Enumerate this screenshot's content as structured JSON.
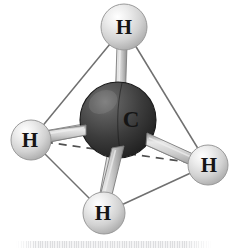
{
  "figure": {
    "background_color": "#ffffff"
  },
  "molecule": {
    "formula": "CH4",
    "geometry": "tetrahedral",
    "center_atom": {
      "id": "carbon-center",
      "label": "C",
      "element": "C",
      "cx": 118,
      "cy": 120,
      "r": 38,
      "fill_color": "#3a3a3a",
      "highlight_color": "#6e6e6e",
      "edge_color": "#1d1d1d"
    },
    "hydrogen_atoms": [
      {
        "id": "hydrogen-top",
        "label": "H",
        "element": "H",
        "position": "top",
        "cx": 124,
        "cy": 27,
        "r": 23,
        "fill_color": "#d8d8d8",
        "highlight_color": "#f7f7f7",
        "edge_color": "#9a9a9a"
      },
      {
        "id": "hydrogen-left",
        "label": "H",
        "element": "H",
        "position": "left",
        "cx": 31,
        "cy": 140,
        "r": 20,
        "fill_color": "#d6d6d6",
        "highlight_color": "#f5f5f5",
        "edge_color": "#9a9a9a"
      },
      {
        "id": "hydrogen-right",
        "label": "H",
        "element": "H",
        "position": "right",
        "cx": 208,
        "cy": 165,
        "r": 20,
        "fill_color": "#d6d6d6",
        "highlight_color": "#f5f5f5",
        "edge_color": "#9a9a9a"
      },
      {
        "id": "hydrogen-bottom",
        "label": "H",
        "element": "H",
        "position": "bottom",
        "cx": 104,
        "cy": 213,
        "r": 21,
        "fill_color": "#d6d6d6",
        "highlight_color": "#f5f5f5",
        "edge_color": "#9a9a9a"
      }
    ],
    "bonds": [
      {
        "id": "bond-c-h-top",
        "from": "carbon-center",
        "to": "hydrogen-top",
        "style": "cylinder"
      },
      {
        "id": "bond-c-h-left",
        "from": "carbon-center",
        "to": "hydrogen-left",
        "style": "cylinder"
      },
      {
        "id": "bond-c-h-right",
        "from": "carbon-center",
        "to": "hydrogen-right",
        "style": "cylinder"
      },
      {
        "id": "bond-c-h-bottom",
        "from": "carbon-center",
        "to": "hydrogen-bottom",
        "style": "cylinder"
      }
    ],
    "tetrahedron_edges": [
      {
        "id": "edge-top-left",
        "from": "hydrogen-top",
        "to": "hydrogen-left",
        "style": "solid"
      },
      {
        "id": "edge-top-right",
        "from": "hydrogen-top",
        "to": "hydrogen-right",
        "style": "solid"
      },
      {
        "id": "edge-top-bottom",
        "from": "hydrogen-top",
        "to": "hydrogen-bottom",
        "style": "solid"
      },
      {
        "id": "edge-left-bottom",
        "from": "hydrogen-left",
        "to": "hydrogen-bottom",
        "style": "solid"
      },
      {
        "id": "edge-bottom-right",
        "from": "hydrogen-bottom",
        "to": "hydrogen-right",
        "style": "solid"
      },
      {
        "id": "edge-left-right",
        "from": "hydrogen-left",
        "to": "hydrogen-right",
        "style": "dashed"
      }
    ],
    "colors": {
      "edge_line": "#6f6f6f",
      "dashed_line": "#4f4f4f",
      "bond_body": "#c9c9c9",
      "bond_outline": "#8a8a8a"
    }
  },
  "labels": {
    "carbon": "C",
    "hydrogen_top": "H",
    "hydrogen_left": "H",
    "hydrogen_right": "H",
    "hydrogen_bottom": "H"
  }
}
